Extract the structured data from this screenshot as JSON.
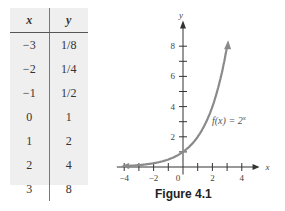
{
  "table": {
    "headers": [
      "x",
      "y"
    ],
    "rows": [
      [
        "−3",
        "1/8"
      ],
      [
        "−2",
        "1/4"
      ],
      [
        "−1",
        "1/2"
      ],
      [
        "0",
        "1"
      ],
      [
        "1",
        "2"
      ],
      [
        "2",
        "4"
      ],
      [
        "3",
        "8"
      ]
    ]
  },
  "caption": "Figure 4.1",
  "chart_data": {
    "type": "line",
    "title": "",
    "function_label": "f(x) = 2^x",
    "xlabel": "x",
    "ylabel": "y",
    "x": [
      -3.5,
      -3,
      -2,
      -1,
      0,
      1,
      2,
      3
    ],
    "series": [
      {
        "name": "f(x) = 2^x",
        "values": [
          0.088,
          0.125,
          0.25,
          0.5,
          1,
          2,
          4,
          8
        ]
      }
    ],
    "x_ticks": [
      -4,
      -3,
      -2,
      -1,
      0,
      1,
      2,
      3,
      4
    ],
    "x_tick_labels": [
      "-4",
      "-2",
      "0",
      "2",
      "4"
    ],
    "y_ticks": [
      1,
      2,
      3,
      4,
      5,
      6,
      7,
      8
    ],
    "y_tick_labels": [
      "2",
      "4",
      "6",
      "8"
    ],
    "xlim": [
      -4.5,
      4.8
    ],
    "ylim": [
      -0.5,
      9.5
    ],
    "grid": false,
    "color": "#8a8a8a"
  }
}
